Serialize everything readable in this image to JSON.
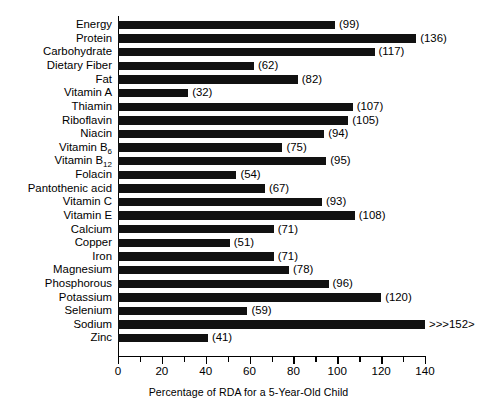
{
  "chart_data": {
    "type": "bar",
    "orientation": "horizontal",
    "title": "",
    "xlabel": "Percentage of RDA for a 5-Year-Old Child",
    "ylabel": "",
    "xlim": [
      0,
      140
    ],
    "grid": false,
    "legend": "none",
    "x_ticks_major": [
      0,
      20,
      40,
      60,
      80,
      100,
      120,
      140
    ],
    "x_ticks_minor": [
      10,
      30,
      50,
      70,
      90,
      110,
      130
    ],
    "x_tick_labels": [
      "0",
      "20",
      "40",
      "60",
      "80",
      "100",
      "120",
      "140"
    ],
    "bar_color": "#111111",
    "categories": [
      "Energy",
      "Protein",
      "Carbohydrate",
      "Dietary Fiber",
      "Fat",
      "Vitamin A",
      "Thiamin",
      "Riboflavin",
      "Niacin",
      "Vitamin B6",
      "Vitamin B12",
      "Folacin",
      "Pantothenic acid",
      "Vitamin C",
      "Vitamin E",
      "Calcium",
      "Copper",
      "Iron",
      "Magnesium",
      "Phosphorous",
      "Potassium",
      "Selenium",
      "Sodium",
      "Zinc"
    ],
    "values": [
      99,
      136,
      117,
      62,
      82,
      32,
      107,
      105,
      94,
      75,
      95,
      54,
      67,
      93,
      108,
      71,
      51,
      71,
      78,
      96,
      120,
      59,
      152,
      41
    ],
    "data_labels": [
      "(99)",
      "(136)",
      "(117)",
      "(62)",
      "(82)",
      "(32)",
      "(107)",
      "(105)",
      "(94)",
      "(75)",
      "(95)",
      "(54)",
      "(67)",
      "(93)",
      "(108)",
      "(71)",
      "(51)",
      "(71)",
      "(78)",
      "(96)",
      "(120)",
      "(59)",
      ">>>152>",
      "(41)"
    ],
    "rows": [
      {
        "label": "Energy",
        "label_html": "Energy",
        "value": 99,
        "display_value": "(99)",
        "clipped": false
      },
      {
        "label": "Protein",
        "label_html": "Protein",
        "value": 136,
        "display_value": "(136)",
        "clipped": false
      },
      {
        "label": "Carbohydrate",
        "label_html": "Carbohydrate",
        "value": 117,
        "display_value": "(117)",
        "clipped": false
      },
      {
        "label": "Dietary Fiber",
        "label_html": "Dietary Fiber",
        "value": 62,
        "display_value": "(62)",
        "clipped": false
      },
      {
        "label": "Fat",
        "label_html": "Fat",
        "value": 82,
        "display_value": "(82)",
        "clipped": false
      },
      {
        "label": "Vitamin A",
        "label_html": "Vitamin A",
        "value": 32,
        "display_value": "(32)",
        "clipped": false
      },
      {
        "label": "Thiamin",
        "label_html": "Thiamin",
        "value": 107,
        "display_value": "(107)",
        "clipped": false
      },
      {
        "label": "Riboflavin",
        "label_html": "Riboflavin",
        "value": 105,
        "display_value": "(105)",
        "clipped": false
      },
      {
        "label": "Niacin",
        "label_html": "Niacin",
        "value": 94,
        "display_value": "(94)",
        "clipped": false
      },
      {
        "label": "Vitamin B6",
        "label_html": "Vitamin B<sub>6</sub>",
        "value": 75,
        "display_value": "(75)",
        "clipped": false
      },
      {
        "label": "Vitamin B12",
        "label_html": "Vitamin B<sub>12</sub>",
        "value": 95,
        "display_value": "(95)",
        "clipped": false
      },
      {
        "label": "Folacin",
        "label_html": "Folacin",
        "value": 54,
        "display_value": "(54)",
        "clipped": false
      },
      {
        "label": "Pantothenic acid",
        "label_html": "Pantothenic acid",
        "value": 67,
        "display_value": "(67)",
        "clipped": false
      },
      {
        "label": "Vitamin C",
        "label_html": "Vitamin C",
        "value": 93,
        "display_value": "(93)",
        "clipped": false
      },
      {
        "label": "Vitamin E",
        "label_html": "Vitamin E",
        "value": 108,
        "display_value": "(108)",
        "clipped": false
      },
      {
        "label": "Calcium",
        "label_html": "Calcium",
        "value": 71,
        "display_value": "(71)",
        "clipped": false
      },
      {
        "label": "Copper",
        "label_html": "Copper",
        "value": 51,
        "display_value": "(51)",
        "clipped": false
      },
      {
        "label": "Iron",
        "label_html": "Iron",
        "value": 71,
        "display_value": "(71)",
        "clipped": false
      },
      {
        "label": "Magnesium",
        "label_html": "Magnesium",
        "value": 78,
        "display_value": "(78)",
        "clipped": false
      },
      {
        "label": "Phosphorous",
        "label_html": "Phosphorous",
        "value": 96,
        "display_value": "(96)",
        "clipped": false
      },
      {
        "label": "Potassium",
        "label_html": "Potassium",
        "value": 120,
        "display_value": "(120)",
        "clipped": false
      },
      {
        "label": "Selenium",
        "label_html": "Selenium",
        "value": 59,
        "display_value": "(59)",
        "clipped": false
      },
      {
        "label": "Sodium",
        "label_html": "Sodium",
        "value": 152,
        "display_value": ">>>152>",
        "clipped": true
      },
      {
        "label": "Zinc",
        "label_html": "Zinc",
        "value": 41,
        "display_value": "(41)",
        "clipped": false
      }
    ]
  }
}
